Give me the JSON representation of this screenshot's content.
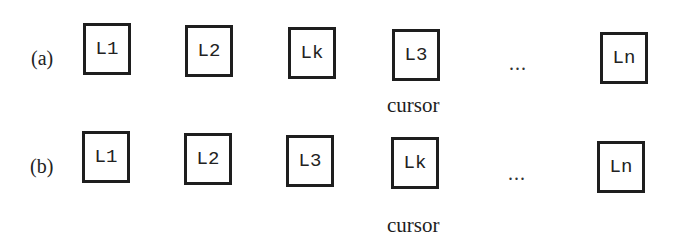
{
  "rows": [
    {
      "label": "(a)",
      "nodes": [
        "L1",
        "L2",
        "Lk",
        "L3",
        "Ln"
      ],
      "ellipsis": "...",
      "cursor_label": "cursor",
      "cursor_under": "L3"
    },
    {
      "label": "(b)",
      "nodes": [
        "L1",
        "L2",
        "L3",
        "Lk",
        "Ln"
      ],
      "ellipsis": "...",
      "cursor_label": "cursor",
      "cursor_under": "Lk"
    }
  ]
}
